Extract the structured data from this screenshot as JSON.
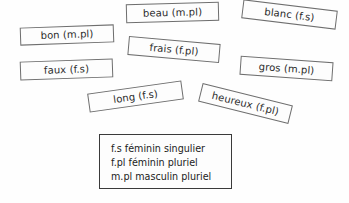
{
  "worksheet": {
    "background_color": "#fefefe",
    "card_border_color": "#6e6e6e",
    "legend_border_color": "#3a3a3a",
    "text_color": "#2b2b2b"
  },
  "cards": [
    {
      "label": "bon (m.pl)",
      "name": "word-card-bon",
      "x": 20,
      "y": 26,
      "w": 94,
      "h": 18,
      "rotation": -2
    },
    {
      "label": "beau (m.pl)",
      "name": "word-card-beau",
      "x": 126,
      "y": 3,
      "w": 93,
      "h": 19,
      "rotation": -1.5
    },
    {
      "label": "blanc (f.s)",
      "name": "word-card-blanc",
      "x": 242,
      "y": 5,
      "w": 95,
      "h": 19,
      "rotation": 7
    },
    {
      "label": "frais (f.pl)",
      "name": "word-card-frais",
      "x": 128,
      "y": 40,
      "w": 92,
      "h": 19,
      "rotation": 5
    },
    {
      "label": "faux (f.s)",
      "name": "word-card-faux",
      "x": 20,
      "y": 60,
      "w": 93,
      "h": 19,
      "rotation": -2
    },
    {
      "label": "gros (m.pl)",
      "name": "word-card-gros",
      "x": 240,
      "y": 59,
      "w": 93,
      "h": 19,
      "rotation": 4
    },
    {
      "label": "long (f.s)",
      "name": "word-card-long",
      "x": 88,
      "y": 87,
      "w": 95,
      "h": 19,
      "rotation": -8
    },
    {
      "label": "heureux (f.pl)",
      "name": "word-card-heureux",
      "x": 199,
      "y": 94,
      "w": 93,
      "h": 19,
      "rotation": 14
    }
  ],
  "legend": {
    "x": 99,
    "y": 134,
    "w": 133,
    "h": 55,
    "lines": [
      "f.s féminin singulier",
      "f.pl féminin pluriel",
      "m.pl masculin pluriel"
    ]
  }
}
